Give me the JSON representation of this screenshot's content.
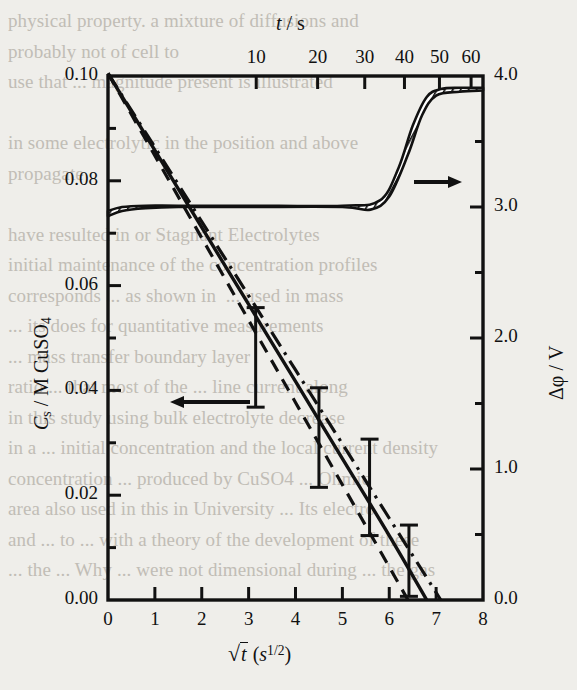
{
  "figure": {
    "name": "concentration-and-potential-vs-sqrt-time"
  },
  "page_background_text": "physical property. a mixture of diffusions and\nprobably not of cell to\nuse that ... magnitude present is illustrated\n\nin some electrolytic in the position and above\npropagate\n\nhave resulted in or Stagnant Electrolytes\ninitial maintenance of the concentration profiles\ncorresponds ... as shown in  ... used in mass\n... its does for quantitative measurements\n... mass transfer boundary layer\nratio ... that most of the ... line current along\nin this study using bulk electrolyte decrease\nin a ... initial concentration and the local current density\nconcentration ... produced by CuSO4 ... Ohmic\narea also used in this in University ... Its electro\nand ... to ... with a theory of the development of these\n... the ... Why ... were not dimensional during ... the gas",
  "axes": {
    "top": {
      "title": "t / s",
      "title_italic_part": "t",
      "ticks": [
        "10",
        "20",
        "30",
        "40",
        "50",
        "60"
      ],
      "values": [
        10,
        20,
        30,
        40,
        50,
        60
      ]
    },
    "bottom": {
      "title_main": "t",
      "title_units": "(s",
      "title_units_sup": "1/2",
      "title_units_close": ")",
      "title_plain": "√t  (s^1/2)",
      "ticks": [
        "0",
        "1",
        "2",
        "3",
        "4",
        "5",
        "6",
        "7",
        "8"
      ],
      "values": [
        0,
        1,
        2,
        3,
        4,
        5,
        6,
        7,
        8
      ]
    },
    "left": {
      "title_symbol": "C",
      "title_sub": "s",
      "title_rest": " / M  CuSO",
      "title_rest_sub": "4",
      "title_plain": "Cs / M CuSO4",
      "ticks": [
        "0.00",
        "0.02",
        "0.04",
        "0.06",
        "0.08",
        "0.10"
      ],
      "values": [
        0.0,
        0.02,
        0.04,
        0.06,
        0.08,
        0.1
      ],
      "minor_step": 0.01
    },
    "right": {
      "title_plain": "Δφ / V",
      "ticks": [
        "0.0",
        "1.0",
        "2.0",
        "3.0",
        "4.0"
      ],
      "values": [
        0.0,
        1.0,
        2.0,
        3.0,
        4.0
      ],
      "minor_step": 0.5
    }
  },
  "annotations": {
    "left_arrow": "←",
    "left_arrow_meaning": "points-to-left-axis",
    "right_arrow": "→",
    "right_arrow_meaning": "points-to-right-axis"
  },
  "chart_data": {
    "type": "line",
    "title": "",
    "xlabel": "√t  (s^1/2)",
    "ylabel": "Cs / M CuSO4",
    "y2label": "Δφ / V",
    "xlim": [
      0,
      8
    ],
    "ylim": [
      0.0,
      0.1
    ],
    "y2lim": [
      0.0,
      4.0
    ],
    "x_top_axis": {
      "label": "t / s",
      "ticks": [
        10,
        20,
        30,
        40,
        50,
        60
      ],
      "relation": "x = sqrt(t)"
    },
    "grid": false,
    "legend": "none",
    "series": [
      {
        "name": "surface concentration (solid)",
        "axis": "left",
        "style": "solid",
        "x": [
          0.0,
          1.0,
          2.0,
          3.0,
          4.0,
          5.0,
          6.0,
          6.8
        ],
        "values": [
          0.1005,
          0.0858,
          0.0711,
          0.0564,
          0.0417,
          0.027,
          0.0123,
          0.0
        ]
      },
      {
        "name": "surface concentration (dashed)",
        "axis": "left",
        "style": "dashed",
        "x": [
          0.0,
          1.0,
          2.0,
          3.0,
          4.0,
          5.0,
          6.0,
          6.4
        ],
        "values": [
          0.1005,
          0.0848,
          0.0691,
          0.0534,
          0.0377,
          0.022,
          0.0063,
          0.0
        ]
      },
      {
        "name": "surface concentration (dash-dot)",
        "axis": "left",
        "style": "dash-dot",
        "x": [
          0.0,
          1.0,
          2.0,
          3.0,
          4.0,
          5.0,
          6.0,
          7.1
        ],
        "values": [
          0.1005,
          0.0864,
          0.0722,
          0.0581,
          0.0439,
          0.0298,
          0.0156,
          0.0
        ]
      },
      {
        "name": "cell potential (hatched band, upper edge)",
        "axis": "right",
        "style": "band-upper",
        "x": [
          0.0,
          0.3,
          0.8,
          1.5,
          3.0,
          5.0,
          5.8,
          6.2,
          6.5,
          6.8,
          7.1,
          7.5,
          8.0
        ],
        "values": [
          2.97,
          3.0,
          3.01,
          3.01,
          3.01,
          3.01,
          3.05,
          3.3,
          3.62,
          3.84,
          3.9,
          3.91,
          3.91
        ]
      },
      {
        "name": "cell potential (hatched band, lower edge)",
        "axis": "right",
        "style": "band-lower",
        "x": [
          0.0,
          0.3,
          0.8,
          1.5,
          3.0,
          5.0,
          5.6,
          6.0,
          6.4,
          6.7,
          7.0,
          7.5,
          8.0
        ],
        "values": [
          2.93,
          2.97,
          2.99,
          3.0,
          3.0,
          3.0,
          2.98,
          3.08,
          3.4,
          3.7,
          3.85,
          3.88,
          3.89
        ]
      }
    ],
    "error_bars": [
      {
        "x": 3.15,
        "y": 0.0463,
        "yerr": 0.0095
      },
      {
        "x": 4.5,
        "y": 0.031,
        "yerr": 0.0095
      },
      {
        "x": 5.58,
        "y": 0.0215,
        "yerr": 0.0092
      },
      {
        "x": 6.42,
        "y": 0.0075,
        "yerr": 0.0068
      }
    ]
  }
}
